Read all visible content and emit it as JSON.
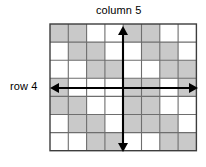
{
  "diagram": {
    "type": "shaded-grid-with-axis-arrows",
    "column_label": "column 5",
    "row_label": "row 4",
    "grid": {
      "columns": 8,
      "rows": 7,
      "cell_width": 18.3,
      "cell_height": 18.1,
      "origin_x": 50,
      "origin_y": 24,
      "border_color": "#3d3d3d",
      "line_color": "#6e6e6e",
      "shaded_color": "#c9c9c9",
      "empty_color": "#ffffff",
      "shaded_cells": [
        [
          1,
          1,
          0,
          0,
          1,
          1,
          0,
          0
        ],
        [
          0,
          1,
          1,
          0,
          0,
          1,
          1,
          0
        ],
        [
          0,
          0,
          1,
          1,
          0,
          0,
          1,
          1
        ],
        [
          1,
          0,
          0,
          0,
          1,
          1,
          0,
          1
        ],
        [
          1,
          1,
          0,
          0,
          1,
          1,
          0,
          0
        ],
        [
          0,
          1,
          1,
          0,
          1,
          1,
          1,
          0
        ],
        [
          0,
          0,
          1,
          1,
          0,
          0,
          1,
          1
        ]
      ]
    },
    "arrows": {
      "vertical": {
        "name": "column-5-arrow",
        "highlight_index": 5,
        "x": 123,
        "y_top": 26,
        "y_bottom": 152,
        "color": "#000000"
      },
      "horizontal": {
        "name": "row-4-arrow",
        "highlight_index": 4,
        "y": 88,
        "x_left": 50,
        "x_right": 198,
        "color": "#000000"
      }
    }
  }
}
